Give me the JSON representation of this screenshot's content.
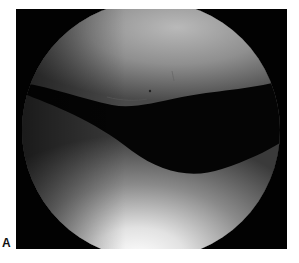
{
  "figure": {
    "panel_label": "A",
    "colors": {
      "frame": "#020202",
      "upper_surface": "#8e8e8e",
      "lower_surface_highlight": "#f4f4f4",
      "joint_space": "#050505"
    }
  }
}
